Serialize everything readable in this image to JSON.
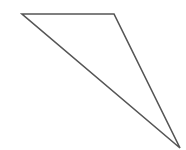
{
  "diagram": {
    "shape": "triangle",
    "vertices": [
      [
        22,
        14
      ],
      [
        114,
        14
      ],
      [
        180,
        148
      ]
    ],
    "stroke": "#555555",
    "stroke_width": 1.6,
    "fill": "none"
  }
}
